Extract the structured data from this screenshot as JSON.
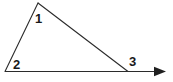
{
  "figure": {
    "background_color": "#ffffff",
    "stroke_color": "#2b2b2b",
    "label_color": "#1a1a1a",
    "stroke_width": 1.1,
    "labels": {
      "angle_1": "1",
      "angle_2": "2",
      "angle_3": "3"
    },
    "vertices": {
      "apex": {
        "x": 38,
        "y": 3
      },
      "bottom_left": {
        "x": 5,
        "y": 71.5
      },
      "bottom_right": {
        "x": 128,
        "y": 71.5
      }
    },
    "ray": {
      "start": {
        "x": 5,
        "y": 71.5
      },
      "end": {
        "x": 166,
        "y": 71.5
      },
      "arrowhead_tip": {
        "x": 166,
        "y": 71.5
      },
      "arrowhead_base": {
        "x": 154,
        "y": 71.5
      },
      "arrowhead_half_width": 5
    },
    "segments": [
      {
        "name": "left-side",
        "from": "bottom_left",
        "to": "apex"
      },
      {
        "name": "hypotenuse",
        "from": "apex",
        "to": "bottom_right"
      },
      {
        "name": "base-ray",
        "from": "bottom_left",
        "to": "ray_end"
      }
    ]
  }
}
